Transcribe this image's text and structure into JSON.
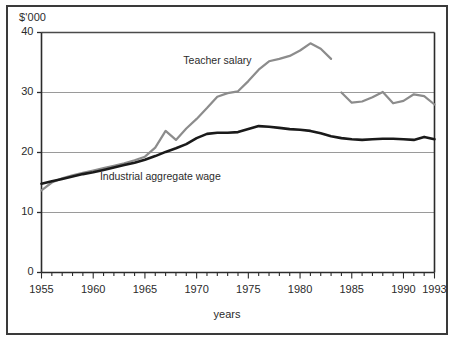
{
  "chart_data": {
    "type": "line",
    "title": "",
    "subtitle": "",
    "xlabel": "years",
    "ylabel": "$'000",
    "yunit_label": "$'000",
    "xlim": [
      1955,
      1993
    ],
    "ylim": [
      0,
      40
    ],
    "grid": "horizontal",
    "legend_position": "inline-annotation",
    "ytick_labels": [
      "0",
      "10",
      "20",
      "30",
      "40"
    ],
    "ytick_values": [
      0,
      10,
      20,
      30,
      40
    ],
    "xtick_labels": [
      "1955",
      "1960",
      "1965",
      "1970",
      "1975",
      "1980",
      "1985",
      "1990",
      "1993"
    ],
    "xtick_values": [
      1955,
      1960,
      1965,
      1970,
      1975,
      1980,
      1985,
      1990,
      1993
    ],
    "minor_xtick_interval": 1,
    "annotations": [
      {
        "text": "Teacher salary",
        "x": 1972,
        "y": 35.2
      },
      {
        "text": "Industrial aggregate wage",
        "x": 1966.5,
        "y": 16.0
      }
    ],
    "series": [
      {
        "name": "Teacher salary",
        "color": "#8c8c8c",
        "line_width": 2.2,
        "x": [
          1955,
          1956,
          1957,
          1958,
          1959,
          1960,
          1961,
          1962,
          1963,
          1964,
          1965,
          1966,
          1967,
          1968,
          1969,
          1970,
          1971,
          1972,
          1973,
          1974,
          1975,
          1976,
          1977,
          1978,
          1979,
          1980,
          1981,
          1982,
          1983
        ],
        "values": [
          13.7,
          15.0,
          15.7,
          16.2,
          16.6,
          17.0,
          17.4,
          17.8,
          18.2,
          18.7,
          19.3,
          20.8,
          23.6,
          22.1,
          24.0,
          25.6,
          27.4,
          29.3,
          29.9,
          30.2,
          31.9,
          33.8,
          35.2,
          35.6,
          36.1,
          37.0,
          38.2,
          37.3,
          35.6
        ]
      },
      {
        "name": "Teacher salary (post-1984 series)",
        "color": "#8c8c8c",
        "line_width": 2.2,
        "x": [
          1984,
          1985,
          1986,
          1987,
          1988,
          1989,
          1990,
          1991,
          1992,
          1993
        ],
        "values": [
          30.0,
          28.3,
          28.5,
          29.2,
          30.1,
          28.2,
          28.6,
          29.7,
          29.4,
          28.0
        ]
      },
      {
        "name": "Industrial aggregate wage",
        "color": "#1a1a1a",
        "line_width": 2.6,
        "x": [
          1955,
          1956,
          1957,
          1958,
          1959,
          1960,
          1961,
          1962,
          1963,
          1964,
          1965,
          1966,
          1967,
          1968,
          1969,
          1970,
          1971,
          1972,
          1973,
          1974,
          1975,
          1976,
          1977,
          1978,
          1979,
          1980,
          1981,
          1982,
          1983,
          1984,
          1985,
          1986,
          1987,
          1988,
          1989,
          1990,
          1991,
          1992,
          1993
        ],
        "values": [
          14.8,
          15.2,
          15.6,
          16.0,
          16.4,
          16.7,
          17.1,
          17.5,
          17.9,
          18.3,
          18.8,
          19.4,
          20.1,
          20.7,
          21.4,
          22.4,
          23.1,
          23.3,
          23.3,
          23.4,
          23.9,
          24.4,
          24.3,
          24.1,
          23.9,
          23.8,
          23.6,
          23.2,
          22.7,
          22.4,
          22.2,
          22.1,
          22.2,
          22.3,
          22.3,
          22.2,
          22.1,
          22.6,
          22.2
        ]
      }
    ]
  }
}
